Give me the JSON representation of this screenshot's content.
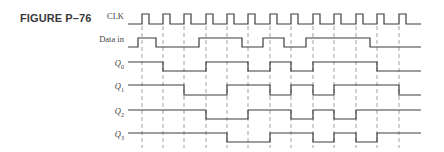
{
  "figure": {
    "title": "FIGURE P–76"
  },
  "signals": [
    {
      "key": "clk",
      "label": "CLK",
      "sub": "",
      "y_high": 14,
      "y_low": 24
    },
    {
      "key": "data",
      "label": "Data in",
      "sub": "",
      "y_high": 38,
      "y_low": 47
    },
    {
      "key": "q0",
      "label": "Q",
      "sub": "0",
      "y_high": 62,
      "y_low": 71
    },
    {
      "key": "q1",
      "label": "Q",
      "sub": "1",
      "y_high": 85,
      "y_low": 95
    },
    {
      "key": "q2",
      "label": "Q",
      "sub": "2",
      "y_high": 110,
      "y_low": 119
    },
    {
      "key": "q3",
      "label": "Q",
      "sub": "3",
      "y_high": 133,
      "y_low": 142
    }
  ],
  "timing": {
    "x_start": 128,
    "x_end": 421,
    "clock_edges": [
      142,
      163,
      184,
      206,
      227,
      248,
      270,
      291,
      313,
      334,
      356,
      377,
      399
    ],
    "clock_pulse_width": 7,
    "waveforms": {
      "data": {
        "initial": 0,
        "transitions": [
          138,
          156,
          199,
          242,
          263,
          284,
          306,
          370
        ]
      },
      "q0": {
        "initial": 1,
        "transitions": [
          163,
          206,
          248,
          270,
          291,
          313,
          377
        ]
      },
      "q1": {
        "initial": 1,
        "transitions": [
          184,
          227,
          270,
          291,
          313,
          334,
          399
        ]
      },
      "q2": {
        "initial": 1,
        "transitions": [
          206,
          248,
          291,
          313,
          334,
          356
        ]
      },
      "q3": {
        "initial": 1,
        "transitions": [
          227,
          270,
          313,
          334,
          356,
          377
        ]
      }
    }
  },
  "colors": {
    "trace": "#3c3c3c",
    "dashed": "#8a8a8a"
  }
}
